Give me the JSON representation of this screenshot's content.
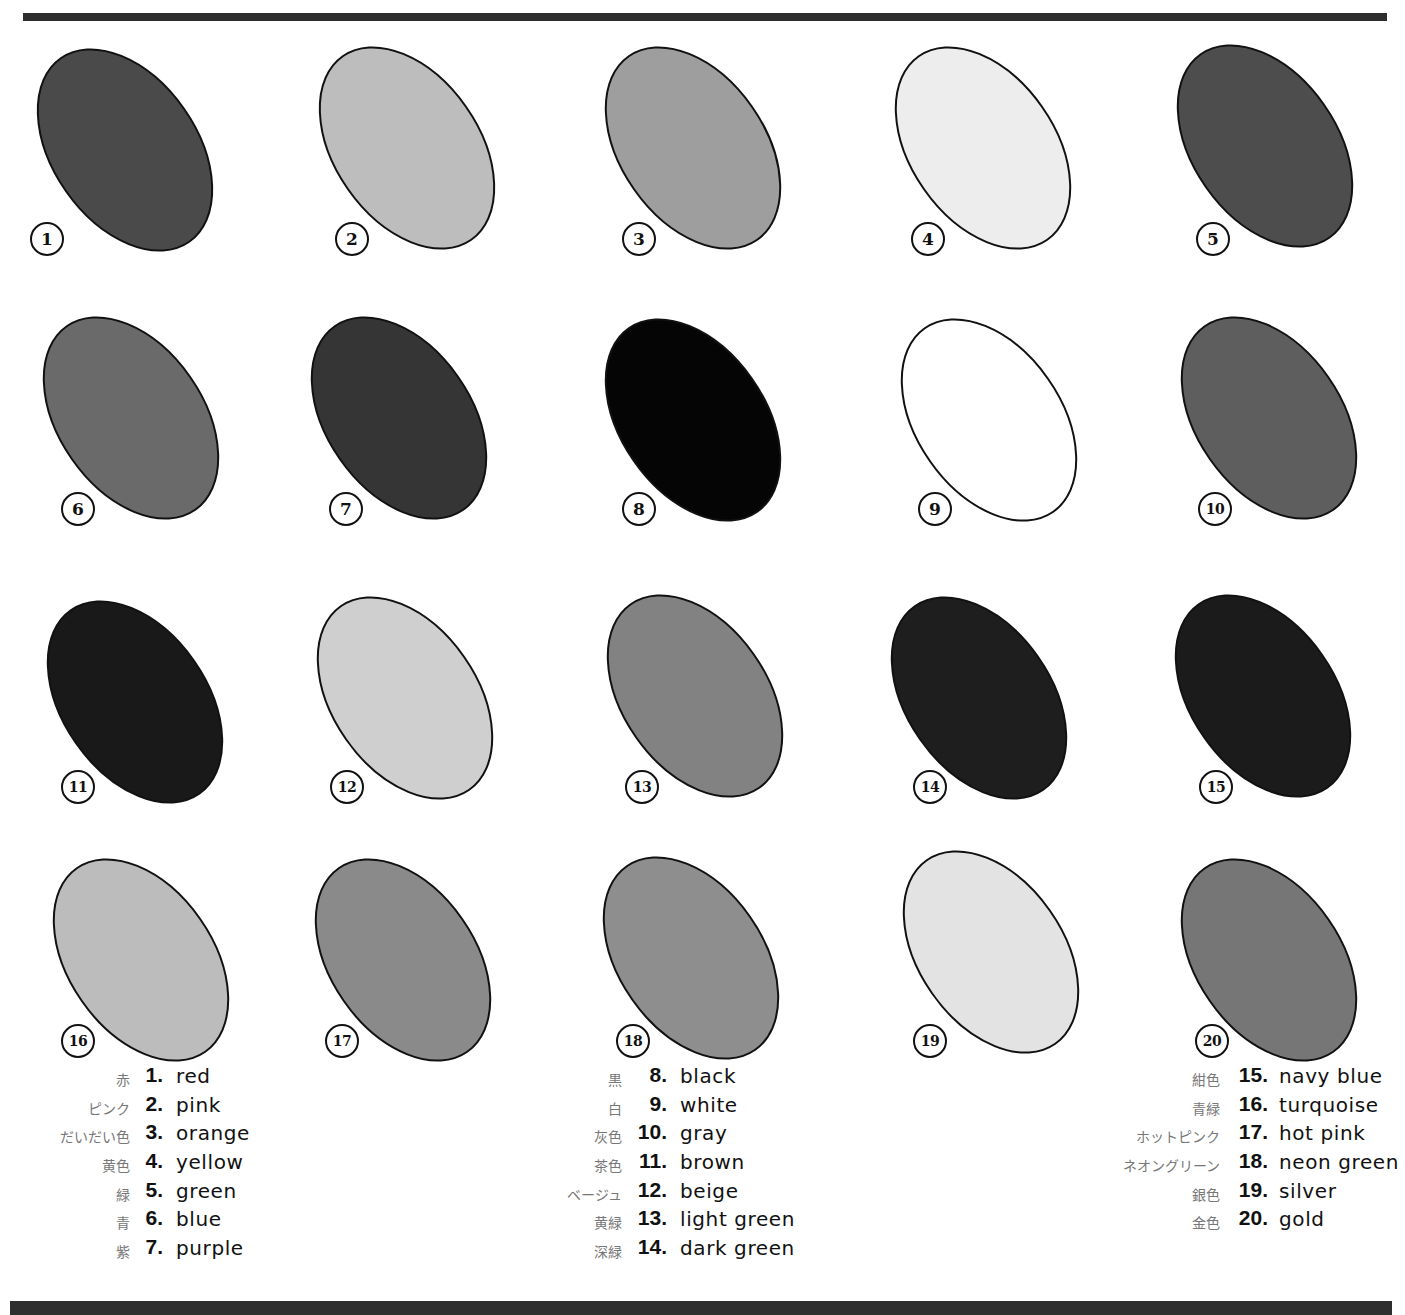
{
  "swatches": [
    {
      "num": "1",
      "fill": "#4a4a4a",
      "x": 30,
      "y": 40,
      "badge_x": 30,
      "badge_y": 222
    },
    {
      "num": "2",
      "fill": "#bdbdbd",
      "x": 312,
      "y": 38,
      "badge_x": 335,
      "badge_y": 222
    },
    {
      "num": "3",
      "fill": "#9e9e9e",
      "x": 598,
      "y": 38,
      "badge_x": 622,
      "badge_y": 222
    },
    {
      "num": "4",
      "fill": "#ededed",
      "x": 888,
      "y": 38,
      "badge_x": 911,
      "badge_y": 222
    },
    {
      "num": "5",
      "fill": "#4d4d4d",
      "x": 1170,
      "y": 36,
      "badge_x": 1196,
      "badge_y": 222
    },
    {
      "num": "6",
      "fill": "#6a6a6a",
      "x": 36,
      "y": 308,
      "badge_x": 61,
      "badge_y": 492
    },
    {
      "num": "7",
      "fill": "#353535",
      "x": 304,
      "y": 308,
      "badge_x": 329,
      "badge_y": 492
    },
    {
      "num": "8",
      "fill": "#050505",
      "x": 598,
      "y": 310,
      "badge_x": 622,
      "badge_y": 492
    },
    {
      "num": "9",
      "fill": "#ffffff",
      "x": 894,
      "y": 310,
      "badge_x": 918,
      "badge_y": 492
    },
    {
      "num": "10",
      "fill": "#5e5e5e",
      "x": 1174,
      "y": 308,
      "badge_x": 1198,
      "badge_y": 492
    },
    {
      "num": "11",
      "fill": "#191919",
      "x": 40,
      "y": 592,
      "badge_x": 61,
      "badge_y": 770
    },
    {
      "num": "12",
      "fill": "#cfcfcf",
      "x": 310,
      "y": 588,
      "badge_x": 330,
      "badge_y": 770
    },
    {
      "num": "13",
      "fill": "#828282",
      "x": 600,
      "y": 586,
      "badge_x": 625,
      "badge_y": 770
    },
    {
      "num": "14",
      "fill": "#1e1e1e",
      "x": 884,
      "y": 588,
      "badge_x": 913,
      "badge_y": 770
    },
    {
      "num": "15",
      "fill": "#1b1b1b",
      "x": 1168,
      "y": 586,
      "badge_x": 1199,
      "badge_y": 770
    },
    {
      "num": "16",
      "fill": "#bcbcbc",
      "x": 46,
      "y": 850,
      "badge_x": 61,
      "badge_y": 1024
    },
    {
      "num": "17",
      "fill": "#8a8a8a",
      "x": 308,
      "y": 850,
      "badge_x": 325,
      "badge_y": 1024
    },
    {
      "num": "18",
      "fill": "#8e8e8e",
      "x": 596,
      "y": 848,
      "badge_x": 616,
      "badge_y": 1024
    },
    {
      "num": "19",
      "fill": "#e3e3e3",
      "x": 896,
      "y": 842,
      "badge_x": 913,
      "badge_y": 1024
    },
    {
      "num": "20",
      "fill": "#767676",
      "x": 1174,
      "y": 850,
      "badge_x": 1195,
      "badge_y": 1024
    }
  ],
  "legend": {
    "col1": [
      {
        "jp": "赤",
        "num": "1.",
        "en": "red"
      },
      {
        "jp": "ピンク",
        "num": "2.",
        "en": "pink"
      },
      {
        "jp": "だいだい色",
        "num": "3.",
        "en": "orange"
      },
      {
        "jp": "黄色",
        "num": "4.",
        "en": "yellow"
      },
      {
        "jp": "緑",
        "num": "5.",
        "en": "green"
      },
      {
        "jp": "青",
        "num": "6.",
        "en": "blue"
      },
      {
        "jp": "紫",
        "num": "7.",
        "en": "purple"
      }
    ],
    "col2": [
      {
        "jp": "黒",
        "num": "8.",
        "en": "black"
      },
      {
        "jp": "白",
        "num": "9.",
        "en": "white"
      },
      {
        "jp": "灰色",
        "num": "10.",
        "en": "gray"
      },
      {
        "jp": "茶色",
        "num": "11.",
        "en": "brown"
      },
      {
        "jp": "ベージュ",
        "num": "12.",
        "en": "beige"
      },
      {
        "jp": "黄緑",
        "num": "13.",
        "en": "light green"
      },
      {
        "jp": "深緑",
        "num": "14.",
        "en": "dark green"
      }
    ],
    "col3": [
      {
        "jp": "紺色",
        "num": "15.",
        "en": "navy blue"
      },
      {
        "jp": "青緑",
        "num": "16.",
        "en": "turquoise"
      },
      {
        "jp": "ホットピンク",
        "num": "17.",
        "en": "hot pink"
      },
      {
        "jp": "ネオングリーン",
        "num": "18.",
        "en": "neon green"
      },
      {
        "jp": "銀色",
        "num": "19.",
        "en": "silver"
      },
      {
        "jp": "金色",
        "num": "20.",
        "en": "gold"
      }
    ]
  }
}
